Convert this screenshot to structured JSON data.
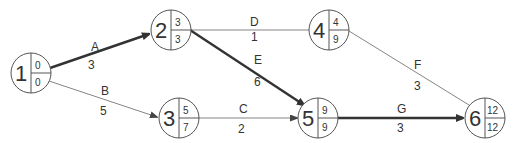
{
  "diagram": {
    "type": "activity-on-arrow network",
    "colors": {
      "critical": "#333333",
      "normal": "#777777",
      "node_stroke": "#555555"
    },
    "nodes": [
      {
        "id": "1",
        "top": "0",
        "bottom": "0"
      },
      {
        "id": "2",
        "top": "3",
        "bottom": "3"
      },
      {
        "id": "3",
        "top": "5",
        "bottom": "7"
      },
      {
        "id": "4",
        "top": "4",
        "bottom": "9"
      },
      {
        "id": "5",
        "top": "9",
        "bottom": "9"
      },
      {
        "id": "6",
        "top": "12",
        "bottom": "12"
      }
    ],
    "edges": [
      {
        "activity": "A",
        "duration": "3",
        "from": "1",
        "to": "2",
        "critical": true
      },
      {
        "activity": "B",
        "duration": "5",
        "from": "1",
        "to": "3",
        "critical": false
      },
      {
        "activity": "D",
        "duration": "1",
        "from": "2",
        "to": "4",
        "critical": false
      },
      {
        "activity": "E",
        "duration": "6",
        "from": "2",
        "to": "5",
        "critical": true
      },
      {
        "activity": "C",
        "duration": "2",
        "from": "3",
        "to": "5",
        "critical": false
      },
      {
        "activity": "F",
        "duration": "3",
        "from": "4",
        "to": "6",
        "critical": false
      },
      {
        "activity": "G",
        "duration": "3",
        "from": "5",
        "to": "6",
        "critical": true
      }
    ]
  }
}
